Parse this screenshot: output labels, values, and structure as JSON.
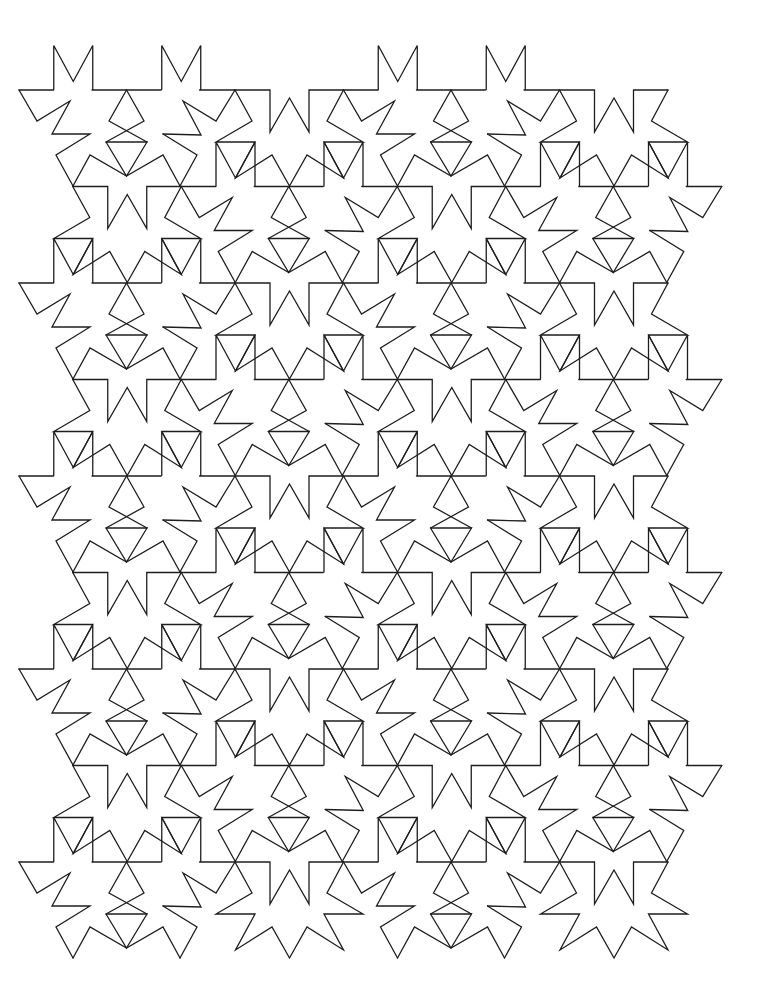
{
  "page": {
    "title": "Nine-pointed star tessellation (line art)",
    "background": "#ffffff",
    "stroke": "#1e1e1e",
    "stroke_width": 1.3
  },
  "pattern": {
    "type": "periodic line-art tessellation",
    "motif": "interlocking nine-pointed stars",
    "canvas": {
      "width": 764,
      "height": 1001
    },
    "first_band_y": 0,
    "band_height": 96.5,
    "band_count": 9,
    "period_x": 324.5,
    "odd_shift": 162.25,
    "groups": {
      "U": [
        {
          "name": "u-star-left-zigzag",
          "points": [
            [
              19,
              90
            ],
            [
              37,
              121
            ],
            [
              70,
              101
            ],
            [
              52,
              134
            ],
            [
              90,
              134
            ],
            [
              56,
              155
            ],
            [
              73,
              186
            ]
          ]
        },
        {
          "name": "u-star-top-edge-left",
          "points": [
            [
              19,
              90
            ],
            [
              53.5,
              90
            ]
          ]
        },
        {
          "name": "u-star-top-edge-middle",
          "points": [
            [
              92,
              90
            ],
            [
              161,
              90
            ]
          ]
        },
        {
          "name": "u-star-top-edge-right",
          "points": [
            [
              199.5,
              90
            ],
            [
              235,
              90
            ]
          ]
        },
        {
          "name": "u-star-bowtie-left-cross",
          "points": [
            [
              126.5,
              90
            ],
            [
              109,
              121
            ],
            [
              147,
              142
            ]
          ]
        },
        {
          "name": "u-star-bowtie-right-cross",
          "points": [
            [
              126.5,
              90
            ],
            [
              144,
              121
            ],
            [
              106,
              142
            ]
          ]
        },
        {
          "name": "u-star-bowtie-triangle",
          "points": [
            [
              106,
              142
            ],
            [
              147,
              142
            ],
            [
              126.5,
              176
            ],
            [
              106,
              142
            ]
          ]
        },
        {
          "name": "u-star-lower-arms",
          "points": [
            [
              73,
              186
            ],
            [
              90,
              155
            ],
            [
              126.5,
              176
            ],
            [
              163,
              155
            ],
            [
              180,
              186
            ]
          ]
        },
        {
          "name": "u-star-right-zigzag",
          "points": [
            [
              163,
              134
            ],
            [
              201,
              135
            ],
            [
              183,
              101
            ],
            [
              216,
              121
            ],
            [
              235,
              90
            ]
          ]
        },
        {
          "name": "u-star-right-lower-arm",
          "points": [
            [
              163,
              134
            ],
            [
              197,
              155
            ],
            [
              180,
              186
            ]
          ]
        }
      ],
      "D": [
        {
          "name": "d-star-top-with-w-notch",
          "points": [
            [
              235,
              90
            ],
            [
              270,
              90
            ],
            [
              270,
              132
            ],
            [
              289.5,
              98
            ],
            [
              309,
              132
            ],
            [
              309,
              90
            ],
            [
              343.5,
              90
            ]
          ]
        },
        {
          "name": "d-star-outline",
          "points": [
            [
              235,
              90
            ],
            [
              252,
              121
            ],
            [
              216,
              142
            ],
            [
              255,
              142
            ],
            [
              235.5,
              178
            ],
            [
              272,
              155
            ],
            [
              289.5,
              186
            ],
            [
              307,
              155
            ],
            [
              343.5,
              178
            ],
            [
              324,
              142
            ],
            [
              363,
              142
            ],
            [
              327,
              121
            ],
            [
              343.5,
              90
            ]
          ]
        }
      ],
      "S": [
        {
          "name": "square-notch-left-sides",
          "points": [
            [
              216,
              186
            ],
            [
              216,
              142
            ],
            [
              235.5,
              178
            ],
            [
              255,
              142
            ],
            [
              255,
              186
            ]
          ]
        },
        {
          "name": "square-notch-right-sides",
          "points": [
            [
              324,
              186
            ],
            [
              324,
              142
            ],
            [
              343.5,
              178
            ],
            [
              363,
              142
            ],
            [
              363,
              186
            ]
          ]
        }
      ]
    },
    "even_copies": [
      {
        "dx": 0,
        "sets": [
          "U",
          "D",
          "S"
        ]
      },
      {
        "dx": 324.5,
        "sets": [
          "U",
          "D",
          "S"
        ]
      }
    ],
    "odd_copies": [
      {
        "dx": -162.25,
        "sets": [
          "D",
          "S"
        ]
      },
      {
        "dx": 162.25,
        "sets": [
          "U",
          "D",
          "S"
        ]
      },
      {
        "dx": 486.75,
        "sets": [
          "U"
        ]
      }
    ],
    "top_notches": [
      {
        "band": -1,
        "dx": -162.25,
        "sets": [
          "S"
        ]
      },
      {
        "band": -1,
        "dx": 162.25,
        "sets": [
          "S"
        ]
      }
    ],
    "omit_on_last_band": [
      "S"
    ],
    "bounds": {
      "x_min": 19,
      "x_max": 720,
      "y_min": 47,
      "y_max": 958
    }
  }
}
